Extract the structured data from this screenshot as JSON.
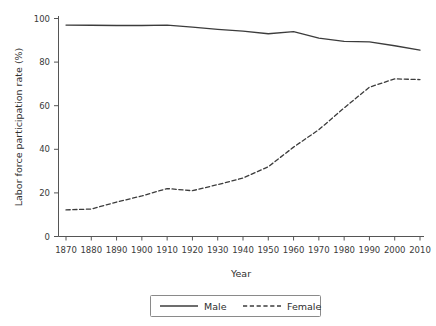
{
  "chart_data": {
    "type": "line",
    "title": "",
    "xlabel": "Year",
    "ylabel": "Labor force participation rate (%)",
    "xlim": [
      1870,
      2010
    ],
    "ylim": [
      0,
      100
    ],
    "grid": false,
    "legend_position": "bottom-center",
    "x": [
      1870,
      1880,
      1890,
      1900,
      1910,
      1920,
      1930,
      1940,
      1950,
      1960,
      1970,
      1980,
      1990,
      2000,
      2010
    ],
    "xticks": [
      "1870",
      "1880",
      "1890",
      "1900",
      "1910",
      "1920",
      "1930",
      "1940",
      "1950",
      "1960",
      "1970",
      "1980",
      "1990",
      "2000",
      "2010"
    ],
    "yticks": [
      "0",
      "20",
      "40",
      "60",
      "80",
      "100"
    ],
    "series": [
      {
        "name": "Male",
        "style": "solid",
        "color": "#3c3c3c",
        "values": [
          97.0,
          96.9,
          96.8,
          96.8,
          97.0,
          96.0,
          95.0,
          94.2,
          93.0,
          94.0,
          91.0,
          89.5,
          89.3,
          87.5,
          85.5
        ]
      },
      {
        "name": "Female",
        "style": "dashed",
        "color": "#3c3c3c",
        "values": [
          12.2,
          12.6,
          15.8,
          18.6,
          22.0,
          21.0,
          23.8,
          26.8,
          32.0,
          41.0,
          49.0,
          59.0,
          68.5,
          72.3,
          72.0
        ]
      }
    ],
    "legend": [
      {
        "label": "Male",
        "style": "solid"
      },
      {
        "label": "Female",
        "style": "dashed"
      }
    ]
  }
}
